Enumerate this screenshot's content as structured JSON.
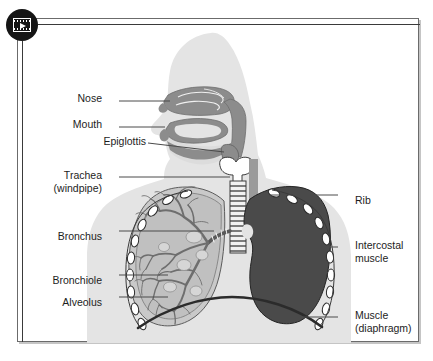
{
  "figure": {
    "badge": {
      "icon": "video-play-icon",
      "aria_label": "Play video"
    },
    "colors": {
      "frame_border": "#6b6b6b",
      "body_silhouette": "#e4e4e4",
      "airway_tissue": "#8c8c8c",
      "right_lung_solid": "#4a4a4a",
      "left_lung_fill": "#c9c9c9",
      "bronchial_tree": "#6e6e6e",
      "rib_fill": "#ffffff",
      "rib_stroke": "#2b2b2b",
      "diaphragm": "#2b2b2b",
      "leader_line": "#4a4a4a",
      "label_text": "#1d1d1d",
      "badge_bg": "#151515",
      "page_bg": "#ffffff"
    }
  },
  "labels": {
    "left": [
      {
        "id": "nose",
        "line1": "Nose",
        "line2": ""
      },
      {
        "id": "mouth",
        "line1": "Mouth",
        "line2": ""
      },
      {
        "id": "epiglottis",
        "line1": "Epiglottis",
        "line2": ""
      },
      {
        "id": "trachea",
        "line1": "Trachea",
        "line2": "(windpipe)"
      },
      {
        "id": "bronchus",
        "line1": "Bronchus",
        "line2": ""
      },
      {
        "id": "bronchiole",
        "line1": "Bronchiole",
        "line2": ""
      },
      {
        "id": "alveolus",
        "line1": "Alveolus",
        "line2": ""
      }
    ],
    "right": [
      {
        "id": "rib",
        "line1": "Rib",
        "line2": ""
      },
      {
        "id": "intercostal",
        "line1": "Intercostal",
        "line2": "muscle"
      },
      {
        "id": "diaphragm",
        "line1": "Muscle",
        "line2": "(diaphragm)"
      }
    ]
  },
  "parts": {
    "nose": "Nose",
    "mouth": "Mouth",
    "epiglottis": "Epiglottis",
    "trachea": "Trachea (windpipe)",
    "bronchus": "Bronchus",
    "bronchiole": "Bronchiole",
    "alveolus": "Alveolus",
    "rib": "Rib",
    "intercostal_muscle": "Intercostal muscle",
    "diaphragm": "Muscle (diaphragm)"
  }
}
